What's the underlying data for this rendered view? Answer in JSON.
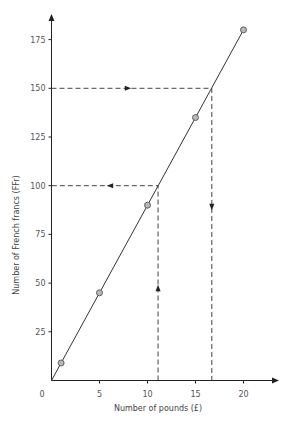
{
  "chart_data": {
    "type": "line",
    "title": "",
    "xlabel": "Number of pounds (£)",
    "ylabel": "Number of French francs (FFr)",
    "xlim": [
      0,
      23
    ],
    "ylim": [
      0,
      190
    ],
    "x_ticks": [
      5,
      10,
      15,
      20
    ],
    "y_ticks": [
      25,
      50,
      75,
      100,
      125,
      150,
      175
    ],
    "origin_label": "0",
    "grid": false,
    "legend": null,
    "series": [
      {
        "name": "Exchange rate line",
        "style": "solid line with circle markers",
        "points": [
          {
            "x": 1,
            "y": 9
          },
          {
            "x": 5,
            "y": 45
          },
          {
            "x": 10,
            "y": 90
          },
          {
            "x": 15,
            "y": 135
          },
          {
            "x": 20,
            "y": 180
          }
        ]
      }
    ],
    "annotations": [
      {
        "type": "dashed-path",
        "description": "From y=150 across to line, then down to x≈16.7",
        "y": 150,
        "x": 16.7,
        "arrows": [
          "right",
          "down"
        ]
      },
      {
        "type": "dashed-path",
        "description": "From x≈11 up to line, then left to y=100",
        "x": 11.1,
        "y": 100,
        "arrows": [
          "up",
          "left"
        ]
      }
    ]
  }
}
